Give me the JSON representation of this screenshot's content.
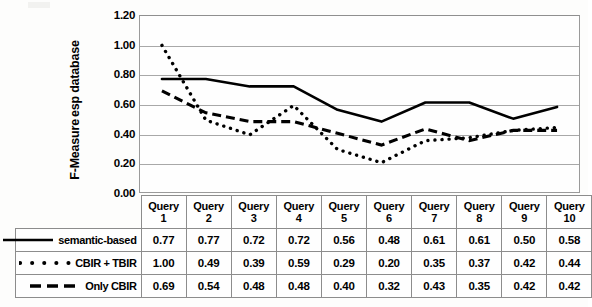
{
  "chart_data": {
    "type": "line",
    "title": "",
    "xlabel": "",
    "ylabel": "F-Measure esp database",
    "ylabel_lines": [
      "F-Measure",
      "esp database"
    ],
    "ylim": [
      0.0,
      1.2
    ],
    "ytick_labels": [
      "1.20",
      "1.00",
      "0.80",
      "0.60",
      "0.40",
      "0.20",
      "0.00"
    ],
    "ytick_values": [
      1.2,
      1.0,
      0.8,
      0.6,
      0.4,
      0.2,
      0.0
    ],
    "grid": true,
    "legend_position": "table-row-headers",
    "categories": [
      "Query 1",
      "Query 2",
      "Query 3",
      "Query 4",
      "Query 5",
      "Query 6",
      "Query 7",
      "Query 8",
      "Query 9",
      "Query 10"
    ],
    "category_label_lines": [
      [
        "Query",
        "1"
      ],
      [
        "Query",
        "2"
      ],
      [
        "Query",
        "3"
      ],
      [
        "Query",
        "4"
      ],
      [
        "Query",
        "5"
      ],
      [
        "Query",
        "6"
      ],
      [
        "Query",
        "7"
      ],
      [
        "Query",
        "8"
      ],
      [
        "Query",
        "9"
      ],
      [
        "Query",
        "10"
      ]
    ],
    "series": [
      {
        "name": "semantic-based",
        "style": "solid",
        "color": "#000000",
        "values": [
          0.77,
          0.77,
          0.72,
          0.72,
          0.56,
          0.48,
          0.61,
          0.61,
          0.5,
          0.58
        ]
      },
      {
        "name": "CBIR + TBIR",
        "style": "dotted",
        "color": "#000000",
        "values": [
          1.0,
          0.49,
          0.39,
          0.59,
          0.29,
          0.2,
          0.35,
          0.37,
          0.42,
          0.44
        ]
      },
      {
        "name": "Only CBIR",
        "style": "dashed",
        "color": "#000000",
        "values": [
          0.69,
          0.54,
          0.48,
          0.48,
          0.4,
          0.32,
          0.43,
          0.35,
          0.42,
          0.42
        ]
      }
    ]
  },
  "table": {
    "corner": "",
    "column_headers": [
      "Query 1",
      "Query 2",
      "Query 3",
      "Query 4",
      "Query 5",
      "Query 6",
      "Query 7",
      "Query 8",
      "Query 9",
      "Query 10"
    ],
    "rows": [
      {
        "label": "semantic-based",
        "marker": "solid-line",
        "cells": [
          "0.77",
          "0.77",
          "0.72",
          "0.72",
          "0.56",
          "0.48",
          "0.61",
          "0.61",
          "0.50",
          "0.58"
        ]
      },
      {
        "label": "CBIR + TBIR",
        "marker": "dotted-line",
        "cells": [
          "1.00",
          "0.49",
          "0.39",
          "0.59",
          "0.29",
          "0.20",
          "0.35",
          "0.37",
          "0.42",
          "0.44"
        ]
      },
      {
        "label": "Only CBIR",
        "marker": "dashed-line",
        "cells": [
          "0.69",
          "0.54",
          "0.48",
          "0.48",
          "0.40",
          "0.32",
          "0.43",
          "0.35",
          "0.42",
          "0.42"
        ]
      }
    ]
  }
}
